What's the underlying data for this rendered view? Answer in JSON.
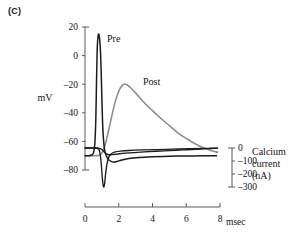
{
  "panel": {
    "label": "(C)"
  },
  "axes": {
    "left": {
      "title": "mV",
      "ticks": [
        "20",
        "0",
        "–20",
        "–40",
        "–60",
        "–80"
      ],
      "values": [
        20,
        0,
        -20,
        -40,
        -60,
        -80
      ],
      "range": [
        -85,
        22
      ]
    },
    "right": {
      "title_line1": "Calcium",
      "title_line2": "current",
      "title_line3": "(nA)",
      "ticks": [
        "0",
        "–100",
        "–200",
        "–300"
      ],
      "values": [
        0,
        -100,
        -200,
        -300
      ],
      "range": [
        -310,
        10
      ]
    },
    "bottom": {
      "ticks": [
        "0",
        "2",
        "4",
        "6",
        "8"
      ],
      "values": [
        0,
        2,
        4,
        6,
        8
      ],
      "unit": "msec",
      "range": [
        0,
        8
      ]
    }
  },
  "series_labels": {
    "pre": "Pre",
    "post": "Post"
  },
  "colors": {
    "pre": "#1c1c1c",
    "post": "#8e8e8e",
    "calcium": "#1c1c1c",
    "axis": "#5a5a5a",
    "text": "#141414"
  },
  "chart_data": {
    "type": "line",
    "title": "",
    "xlabel": "msec",
    "ylabel": "mV",
    "y2label": "Calcium current (nA)",
    "xlim": [
      0,
      8
    ],
    "ylim": [
      -85,
      22
    ],
    "y2lim": [
      -310,
      10
    ],
    "grid": false,
    "legend": "inline-annotations",
    "xticks": [
      0,
      2,
      4,
      6,
      8
    ],
    "yticks": [
      20,
      0,
      -20,
      -40,
      -60,
      -80
    ],
    "y2ticks": [
      0,
      -100,
      -200,
      -300
    ],
    "series": [
      {
        "name": "Pre",
        "axis": "left",
        "units": "mV",
        "color": "#1c1c1c",
        "peak_x": 0.82,
        "peak_y": 15,
        "baseline": -70,
        "x": [
          0.0,
          0.2,
          0.4,
          0.5,
          0.58,
          0.64,
          0.68,
          0.72,
          0.76,
          0.8,
          0.84,
          0.88,
          0.92,
          0.96,
          1.0,
          1.04,
          1.08,
          1.14,
          1.2,
          1.3,
          1.42,
          1.55,
          1.7,
          1.9,
          2.2,
          2.6,
          3.2,
          4.0,
          5.0,
          6.0,
          7.0,
          7.8
        ],
        "y": [
          -70,
          -70,
          -69.5,
          -68,
          -62,
          -45,
          -20,
          3,
          12,
          15,
          14,
          10,
          2,
          -12,
          -30,
          -46,
          -56,
          -64,
          -68,
          -71,
          -73,
          -74,
          -74.5,
          -74,
          -73,
          -72,
          -71.3,
          -70.8,
          -70.4,
          -70.2,
          -70.1,
          -70
        ]
      },
      {
        "name": "Post",
        "axis": "left",
        "units": "mV",
        "color": "#8e8e8e",
        "peak_x": 2.3,
        "peak_y": -20,
        "baseline": -70,
        "x": [
          0.0,
          0.6,
          0.9,
          1.05,
          1.2,
          1.35,
          1.5,
          1.65,
          1.8,
          1.95,
          2.1,
          2.3,
          2.5,
          2.7,
          2.95,
          3.25,
          3.6,
          4.0,
          4.5,
          5.0,
          5.5,
          6.0,
          6.5,
          7.0,
          7.5,
          7.85
        ],
        "y": [
          -70,
          -70,
          -69.5,
          -67,
          -62,
          -55,
          -47,
          -39,
          -32,
          -26.5,
          -22.5,
          -20,
          -20.5,
          -22.5,
          -25.5,
          -29.5,
          -34,
          -38.5,
          -44,
          -49,
          -54,
          -58,
          -61.5,
          -64.5,
          -66.5,
          -67.5
        ]
      },
      {
        "name": "Calcium current (fast)",
        "axis": "right",
        "units": "nA",
        "color": "#1c1c1c",
        "peak_x": 1.08,
        "peak_y": -300,
        "baseline": 0,
        "x": [
          0.0,
          0.5,
          0.7,
          0.8,
          0.86,
          0.9,
          0.94,
          0.98,
          1.02,
          1.06,
          1.1,
          1.14,
          1.18,
          1.22,
          1.28,
          1.36,
          1.46,
          1.6,
          1.8,
          2.1,
          2.6,
          3.3,
          4.2,
          5.2,
          6.2,
          7.1,
          7.85
        ],
        "y": [
          0,
          0,
          -2,
          -8,
          -22,
          -48,
          -90,
          -150,
          -220,
          -275,
          -300,
          -292,
          -255,
          -200,
          -140,
          -90,
          -58,
          -40,
          -30,
          -24,
          -19,
          -15,
          -12,
          -9,
          -6,
          -3,
          -1
        ]
      },
      {
        "name": "Calcium current (slow)",
        "axis": "right",
        "units": "nA",
        "color": "#1c1c1c",
        "peak_x": 1.45,
        "peak_y": -52,
        "baseline": 0,
        "x": [
          0.0,
          0.6,
          0.85,
          1.0,
          1.12,
          1.24,
          1.36,
          1.48,
          1.62,
          1.8,
          2.05,
          2.4,
          2.9,
          3.5,
          4.2,
          5.0,
          5.8,
          6.6,
          7.3,
          7.85
        ],
        "y": [
          0,
          0,
          -3,
          -12,
          -28,
          -42,
          -50,
          -52,
          -51,
          -48,
          -44,
          -40,
          -35,
          -30,
          -25,
          -20,
          -15,
          -10,
          -5,
          -1
        ]
      }
    ]
  }
}
